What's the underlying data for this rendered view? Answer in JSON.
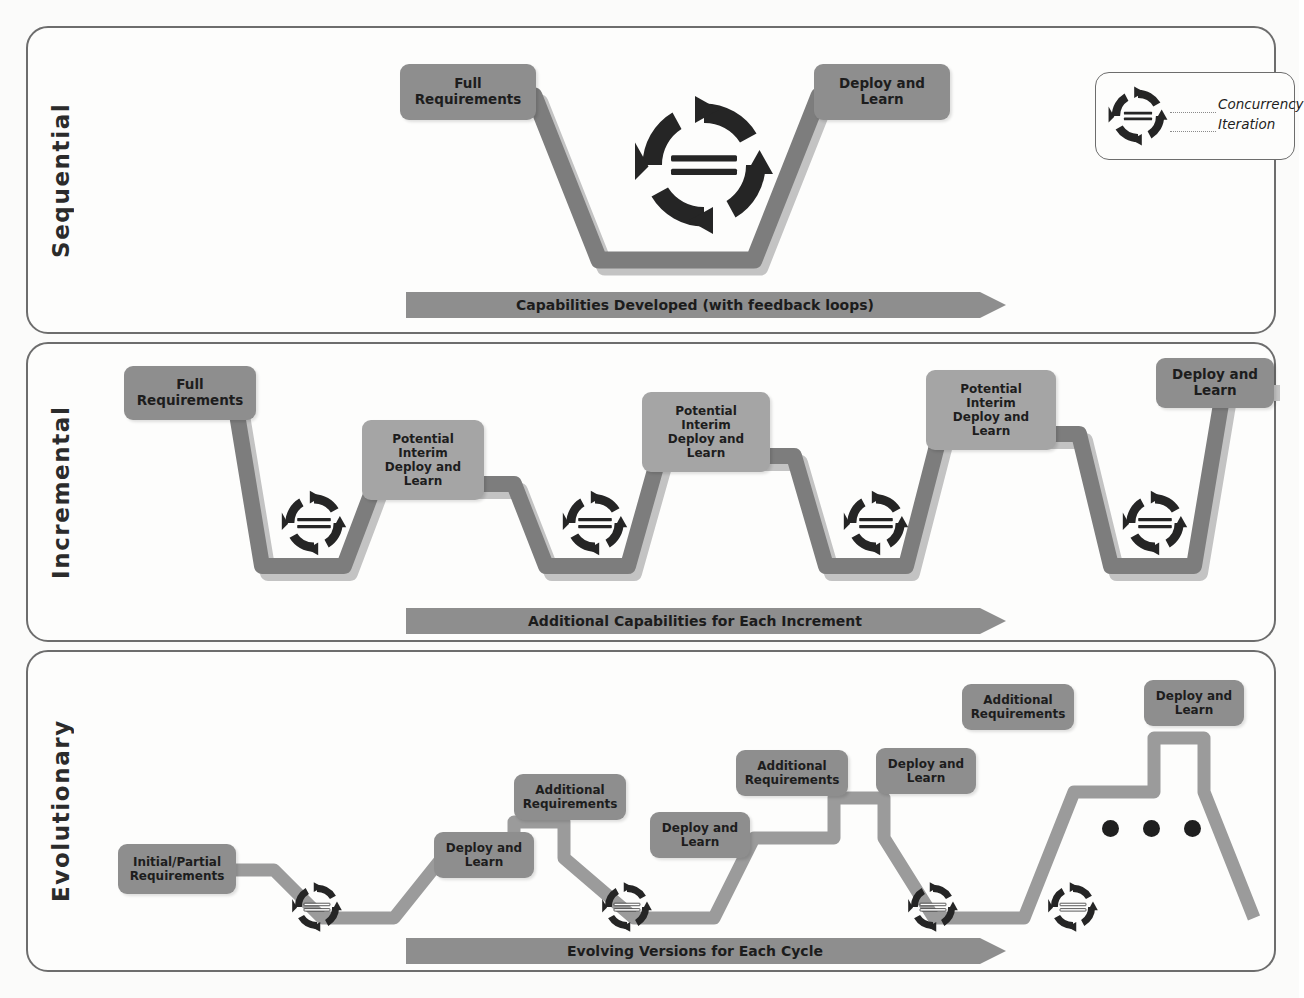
{
  "diagram": {
    "colors": {
      "node_dark": "#8e8e8e",
      "node_light": "#a5a5a5",
      "path_dark": "#7f7f7f",
      "path_light": "#bdbdbd",
      "arrow_bar": "#8e8e8e",
      "icon_dark": "#1f1f1f",
      "panel_border": "#6d6d6d",
      "background": "#fbfbfa"
    }
  },
  "legend": {
    "icon": "concurrency-iteration-icon",
    "line1": "Concurrency",
    "line2": "Iteration"
  },
  "panels": [
    {
      "id": "sequential",
      "label": "Sequential",
      "flow_arrow": "Capabilities Developed (with feedback loops)",
      "nodes": [
        {
          "id": "seq-full-req",
          "text": "Full\nRequirements",
          "tone": "dark"
        },
        {
          "id": "seq-deploy",
          "text": "Deploy and\nLearn",
          "tone": "dark"
        }
      ],
      "cycle_icons": 1
    },
    {
      "id": "incremental",
      "label": "Incremental",
      "flow_arrow": "Additional Capabilities for Each Increment",
      "nodes": [
        {
          "id": "inc-full-req",
          "text": "Full\nRequirements",
          "tone": "dark"
        },
        {
          "id": "inc-pi-1",
          "text": "Potential\nInterim\nDeploy and\nLearn",
          "tone": "light"
        },
        {
          "id": "inc-pi-2",
          "text": "Potential\nInterim\nDeploy and\nLearn",
          "tone": "light"
        },
        {
          "id": "inc-pi-3",
          "text": "Potential\nInterim\nDeploy and\nLearn",
          "tone": "light"
        },
        {
          "id": "inc-deploy",
          "text": "Deploy and\nLearn",
          "tone": "dark"
        }
      ],
      "cycle_icons": 4
    },
    {
      "id": "evolutionary",
      "label": "Evolutionary",
      "flow_arrow": "Evolving Versions for Each Cycle",
      "nodes": [
        {
          "id": "evo-init-req",
          "text": "Initial/Partial\nRequirements",
          "tone": "dark"
        },
        {
          "id": "evo-dep-1",
          "text": "Deploy and\nLearn",
          "tone": "dark"
        },
        {
          "id": "evo-add-1",
          "text": "Additional\nRequirements",
          "tone": "dark"
        },
        {
          "id": "evo-dep-2",
          "text": "Deploy and\nLearn",
          "tone": "dark"
        },
        {
          "id": "evo-add-2",
          "text": "Additional\nRequirements",
          "tone": "dark"
        },
        {
          "id": "evo-dep-3",
          "text": "Deploy and\nLearn",
          "tone": "dark"
        },
        {
          "id": "evo-add-3",
          "text": "Additional\nRequirements",
          "tone": "dark"
        },
        {
          "id": "evo-dep-4",
          "text": "Deploy and\nLearn",
          "tone": "dark"
        }
      ],
      "cycle_icons": 4,
      "continuation": "• • •"
    }
  ]
}
